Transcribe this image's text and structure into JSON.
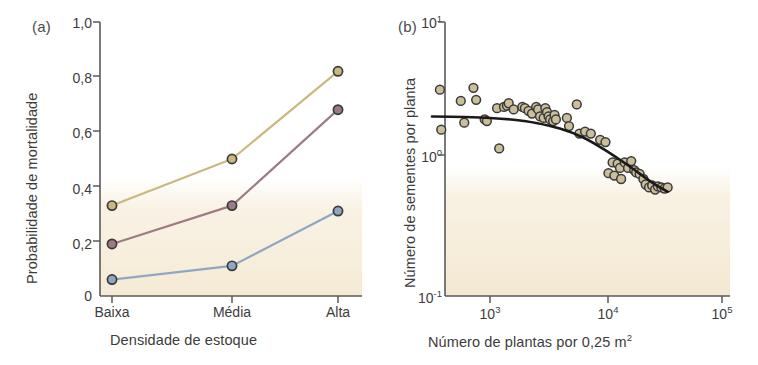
{
  "figure": {
    "background_color": "#ffffff",
    "paper_tint_color": "#f7eedc"
  },
  "panels": [
    {
      "id": "a",
      "label": "(a)",
      "x_axis_title": "Densidade de estoque",
      "y_axis_title": "Probabilidade de mortalidade",
      "y_tick_labels": [
        "1,0",
        "0,8",
        "0,6",
        "0,4",
        "0,2",
        "0"
      ],
      "x_tick_labels": [
        "Baixa",
        "Média",
        "Alta"
      ]
    },
    {
      "id": "b",
      "label": "(b)",
      "x_axis_title": "Número de plantas por 0,25 m",
      "x_axis_title_sup": "2",
      "y_axis_title": "Número de sementes por planta",
      "y_tick_labels": [
        "10",
        "10",
        "10"
      ],
      "y_tick_sups": [
        "1",
        "0",
        "-1"
      ],
      "x_tick_labels": [
        "10",
        "10",
        "10"
      ],
      "x_tick_sups": [
        "3",
        "4",
        "5"
      ]
    }
  ],
  "colors": {
    "series_tan": "#cbb87e",
    "series_mauve": "#9c7b85",
    "series_blue": "#8fa7c4",
    "marker_edge": "#3a3a3a",
    "axis": "#5a5a5a",
    "curve": "#1a1a1a",
    "scatter_fill": "#cbbe9a",
    "paper_tint": "#f7eedc"
  },
  "chart_data": [
    {
      "type": "line",
      "panel": "a",
      "title": "",
      "xlabel": "Densidade de estoque",
      "ylabel": "Probabilidade de mortalidade",
      "categories": [
        "Baixa",
        "Média",
        "Alta"
      ],
      "ylim": [
        0,
        1.0
      ],
      "yticks": [
        0,
        0.2,
        0.4,
        0.6,
        0.8,
        1.0
      ],
      "ytick_labels": [
        "0",
        "0,2",
        "0,4",
        "0,6",
        "0,8",
        "1,0"
      ],
      "grid": false,
      "legend": "none",
      "series": [
        {
          "name": "series-tan",
          "color": "#cbb87e",
          "values": [
            0.33,
            0.5,
            0.82
          ]
        },
        {
          "name": "series-mauve",
          "color": "#9c7b85",
          "values": [
            0.19,
            0.33,
            0.68
          ]
        },
        {
          "name": "series-blue",
          "color": "#8fa7c4",
          "values": [
            0.06,
            0.11,
            0.31
          ]
        }
      ]
    },
    {
      "type": "scatter",
      "panel": "b",
      "title": "",
      "xlabel": "Número de plantas por 0,25 m2",
      "ylabel": "Número de sementes por planta",
      "xscale": "log",
      "yscale": "log",
      "xlim": [
        316,
        100000
      ],
      "ylim": [
        0.1,
        10
      ],
      "xticks": [
        1000,
        10000,
        100000
      ],
      "xtick_labels": [
        "10^3",
        "10^4",
        "10^5"
      ],
      "yticks": [
        0.1,
        1,
        10
      ],
      "ytick_labels": [
        "10^-1",
        "10^0",
        "10^1"
      ],
      "grid": false,
      "legend": "none",
      "points": [
        [
          370,
          3.1
        ],
        [
          380,
          1.55
        ],
        [
          560,
          2.55
        ],
        [
          600,
          1.75
        ],
        [
          720,
          3.2
        ],
        [
          760,
          2.6
        ],
        [
          900,
          1.85
        ],
        [
          940,
          1.8
        ],
        [
          1150,
          2.25
        ],
        [
          1200,
          1.12
        ],
        [
          1320,
          2.3
        ],
        [
          1400,
          2.35
        ],
        [
          1450,
          2.45
        ],
        [
          1600,
          2.2
        ],
        [
          1900,
          2.3
        ],
        [
          2000,
          2.25
        ],
        [
          2150,
          2.15
        ],
        [
          2300,
          2.05
        ],
        [
          2500,
          2.3
        ],
        [
          2600,
          2.2
        ],
        [
          2700,
          1.95
        ],
        [
          2900,
          1.9
        ],
        [
          3000,
          2.25
        ],
        [
          3100,
          2.1
        ],
        [
          3200,
          1.95
        ],
        [
          3300,
          1.85
        ],
        [
          3500,
          1.8
        ],
        [
          3600,
          2.0
        ],
        [
          3700,
          1.85
        ],
        [
          4600,
          1.9
        ],
        [
          4800,
          1.65
        ],
        [
          5600,
          2.4
        ],
        [
          5900,
          1.45
        ],
        [
          6600,
          1.5
        ],
        [
          7400,
          1.45
        ],
        [
          8900,
          1.3
        ],
        [
          9900,
          1.25
        ],
        [
          10500,
          0.73
        ],
        [
          11400,
          0.88
        ],
        [
          11800,
          0.7
        ],
        [
          12600,
          0.86
        ],
        [
          13200,
          0.8
        ],
        [
          13500,
          0.66
        ],
        [
          14500,
          0.88
        ],
        [
          15500,
          0.8
        ],
        [
          16500,
          0.9
        ],
        [
          17500,
          0.77
        ],
        [
          18200,
          0.74
        ],
        [
          19500,
          0.72
        ],
        [
          21000,
          0.66
        ],
        [
          22000,
          0.6
        ],
        [
          23500,
          0.57
        ],
        [
          25000,
          0.59
        ],
        [
          26500,
          0.55
        ],
        [
          28000,
          0.58
        ],
        [
          30000,
          0.57
        ],
        [
          32000,
          0.56
        ],
        [
          34000,
          0.57
        ]
      ],
      "fit_curve": {
        "name": "fitted-curve",
        "description": "decreasing saturating curve, flat at left then declining",
        "points": [
          [
            316,
            1.95
          ],
          [
            600,
            1.93
          ],
          [
            1000,
            1.9
          ],
          [
            1600,
            1.84
          ],
          [
            2500,
            1.74
          ],
          [
            4000,
            1.58
          ],
          [
            6300,
            1.36
          ],
          [
            10000,
            1.08
          ],
          [
            16000,
            0.82
          ],
          [
            25000,
            0.62
          ],
          [
            34000,
            0.53
          ]
        ]
      }
    }
  ]
}
